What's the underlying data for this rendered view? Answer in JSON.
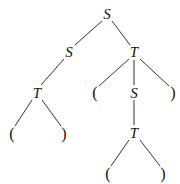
{
  "diagram": {
    "type": "parse-tree",
    "top_clipped_text": "",
    "nodes": [
      {
        "id": "n0",
        "label": "S",
        "x": 107,
        "y": 14,
        "kind": "symbol"
      },
      {
        "id": "n1",
        "label": "S",
        "x": 69,
        "y": 52,
        "kind": "symbol"
      },
      {
        "id": "n2",
        "label": "T",
        "x": 134,
        "y": 52,
        "kind": "symbol"
      },
      {
        "id": "n3",
        "label": "T",
        "x": 37,
        "y": 93,
        "kind": "symbol"
      },
      {
        "id": "n4",
        "label": "(",
        "x": 95,
        "y": 93,
        "kind": "paren"
      },
      {
        "id": "n5",
        "label": "S",
        "x": 134,
        "y": 93,
        "kind": "symbol"
      },
      {
        "id": "n6",
        "label": ")",
        "x": 173,
        "y": 93,
        "kind": "paren"
      },
      {
        "id": "n7",
        "label": "(",
        "x": 12,
        "y": 134,
        "kind": "paren"
      },
      {
        "id": "n8",
        "label": ")",
        "x": 64,
        "y": 134,
        "kind": "paren"
      },
      {
        "id": "n9",
        "label": "T",
        "x": 134,
        "y": 133,
        "kind": "symbol"
      },
      {
        "id": "n10",
        "label": "(",
        "x": 108,
        "y": 174,
        "kind": "paren"
      },
      {
        "id": "n11",
        "label": ")",
        "x": 163,
        "y": 174,
        "kind": "paren"
      }
    ],
    "edges": [
      {
        "from": "n0",
        "to": "n1",
        "x1": 102,
        "y1": 21,
        "x2": 75,
        "y2": 45
      },
      {
        "from": "n0",
        "to": "n2",
        "x1": 112,
        "y1": 21,
        "x2": 130,
        "y2": 45
      },
      {
        "from": "n1",
        "to": "n3",
        "x1": 64,
        "y1": 59,
        "x2": 41,
        "y2": 85
      },
      {
        "from": "n2",
        "to": "n4",
        "x1": 129,
        "y1": 59,
        "x2": 99,
        "y2": 86
      },
      {
        "from": "n2",
        "to": "n5",
        "x1": 134,
        "y1": 60,
        "x2": 134,
        "y2": 85
      },
      {
        "from": "n2",
        "to": "n6",
        "x1": 140,
        "y1": 59,
        "x2": 169,
        "y2": 86
      },
      {
        "from": "n3",
        "to": "n7",
        "x1": 32,
        "y1": 100,
        "x2": 15,
        "y2": 126
      },
      {
        "from": "n3",
        "to": "n8",
        "x1": 42,
        "y1": 100,
        "x2": 61,
        "y2": 126
      },
      {
        "from": "n5",
        "to": "n9",
        "x1": 134,
        "y1": 100,
        "x2": 134,
        "y2": 125
      },
      {
        "from": "n9",
        "to": "n10",
        "x1": 129,
        "y1": 140,
        "x2": 111,
        "y2": 166
      },
      {
        "from": "n9",
        "to": "n11",
        "x1": 140,
        "y1": 140,
        "x2": 160,
        "y2": 166
      }
    ],
    "colors": {
      "line": "#333333",
      "text": "#111111",
      "background": "#ffffff"
    }
  }
}
